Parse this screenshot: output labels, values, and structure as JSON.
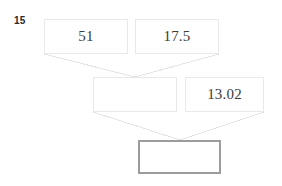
{
  "figure": {
    "label": "15",
    "background_color": "#ffffff",
    "border_color_light": "#e9e9e9",
    "border_color_dark": "#9c9c9c",
    "edge_color": "#e4e4e4",
    "text_color": "#3a3a3a"
  },
  "diagram": {
    "type": "tree",
    "levels": 3,
    "nodes": [
      {
        "id": "n1",
        "value": "51",
        "level": 1,
        "x": 44,
        "y": 19,
        "width": 84,
        "height": 35,
        "border": "light",
        "empty": false
      },
      {
        "id": "n2",
        "value": "17.5",
        "level": 1,
        "x": 135,
        "y": 19,
        "width": 84,
        "height": 35,
        "border": "light",
        "empty": false
      },
      {
        "id": "n3",
        "value": "",
        "level": 2,
        "x": 93,
        "y": 77,
        "width": 84,
        "height": 35,
        "border": "light",
        "empty": true
      },
      {
        "id": "n4",
        "value": "13.02",
        "level": 2,
        "x": 185,
        "y": 77,
        "width": 79,
        "height": 35,
        "border": "light",
        "empty": false
      },
      {
        "id": "n5",
        "value": "",
        "level": 3,
        "x": 138,
        "y": 140,
        "width": 83,
        "height": 34,
        "border": "dark",
        "empty": true
      }
    ],
    "edges": [
      {
        "from": "n1",
        "to": "n3",
        "x1": 44,
        "y1": 54,
        "x2": 135,
        "y2": 77
      },
      {
        "from": "n2",
        "to": "n3",
        "x1": 219,
        "y1": 54,
        "x2": 135,
        "y2": 77
      },
      {
        "from": "n3",
        "to": "n5",
        "x1": 93,
        "y1": 112,
        "x2": 180,
        "y2": 140
      },
      {
        "from": "n4",
        "to": "n5",
        "x1": 264,
        "y1": 112,
        "x2": 180,
        "y2": 140
      }
    ]
  }
}
